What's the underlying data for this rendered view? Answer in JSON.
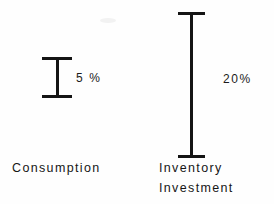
{
  "chart_data": {
    "type": "bar",
    "title": "",
    "subtitle": "",
    "xlabel": "",
    "ylabel": "",
    "grid": false,
    "legend": null,
    "categories": [
      "Consumption",
      "Inventory Investment"
    ],
    "values": [
      5,
      20
    ],
    "units": "%",
    "ylim": [
      0,
      20
    ],
    "series": [
      {
        "name": "Volatility (percent)",
        "values": [
          5,
          20
        ]
      }
    ],
    "annotations": [
      {
        "category": "Consumption",
        "value": 5,
        "data_label": "5 %",
        "marker": "i-beam-range"
      },
      {
        "category": "Inventory Investment",
        "value": 20,
        "data_label": "20%",
        "marker": "i-beam-range"
      }
    ]
  },
  "figure": {
    "background": "#fefefe",
    "ink_color": "#141414"
  },
  "markers": {
    "consumption": {
      "name": "consumption-range-marker",
      "value_label": "5 %"
    },
    "inventory": {
      "name": "inventory-investment-range-marker",
      "value_label": "20%"
    }
  },
  "labels": {
    "consumption": "Consumption",
    "inventory_line1": "Inventory",
    "inventory_line2": "Investment"
  }
}
